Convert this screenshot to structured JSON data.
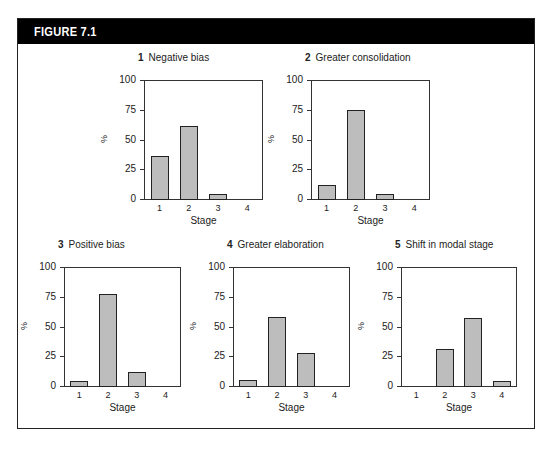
{
  "figure": {
    "title": "FIGURE 7.1"
  },
  "chart_data": [
    {
      "type": "bar",
      "panel_number": "1",
      "title": "Negative bias",
      "categories": [
        "1",
        "2",
        "3",
        "4"
      ],
      "values": [
        37,
        62,
        5,
        0
      ],
      "xlabel": "Stage",
      "ylabel": "%",
      "ylim": [
        0,
        100
      ],
      "yticks": [
        0,
        25,
        50,
        75,
        100
      ],
      "grid": false
    },
    {
      "type": "bar",
      "panel_number": "2",
      "title": "Greater consolidation",
      "categories": [
        "1",
        "2",
        "3",
        "4"
      ],
      "values": [
        13,
        76,
        5,
        0
      ],
      "xlabel": "Stage",
      "ylabel": "%",
      "ylim": [
        0,
        100
      ],
      "yticks": [
        0,
        25,
        50,
        75,
        100
      ],
      "grid": false
    },
    {
      "type": "bar",
      "panel_number": "3",
      "title": "Positive bias",
      "categories": [
        "1",
        "2",
        "3",
        "4"
      ],
      "values": [
        5,
        78,
        13,
        0
      ],
      "xlabel": "Stage",
      "ylabel": "%",
      "ylim": [
        0,
        100
      ],
      "yticks": [
        0,
        25,
        50,
        75,
        100
      ],
      "grid": false
    },
    {
      "type": "bar",
      "panel_number": "4",
      "title": "Greater elaboration",
      "categories": [
        "1",
        "2",
        "3",
        "4"
      ],
      "values": [
        6,
        59,
        29,
        0
      ],
      "xlabel": "Stage",
      "ylabel": "%",
      "ylim": [
        0,
        100
      ],
      "yticks": [
        0,
        25,
        50,
        75,
        100
      ],
      "grid": false
    },
    {
      "type": "bar",
      "panel_number": "5",
      "title": "Shift in modal stage",
      "categories": [
        "1",
        "2",
        "3",
        "4"
      ],
      "values": [
        0,
        32,
        58,
        5
      ],
      "xlabel": "Stage",
      "ylabel": "%",
      "ylim": [
        0,
        100
      ],
      "yticks": [
        0,
        25,
        50,
        75,
        100
      ],
      "grid": false
    }
  ],
  "layout": {
    "panels": [
      {
        "plot_left": 144,
        "plot_top": 80,
        "plot_width": 119,
        "plot_height": 120
      },
      {
        "plot_left": 311,
        "plot_top": 80,
        "plot_width": 119,
        "plot_height": 120
      },
      {
        "plot_left": 64,
        "plot_top": 267,
        "plot_width": 117,
        "plot_height": 120
      },
      {
        "plot_left": 233,
        "plot_top": 267,
        "plot_width": 117,
        "plot_height": 120
      },
      {
        "plot_left": 401,
        "plot_top": 267,
        "plot_width": 116,
        "plot_height": 120
      }
    ],
    "bar_fill": "#bdbdbd",
    "header_bg": "#000000"
  }
}
